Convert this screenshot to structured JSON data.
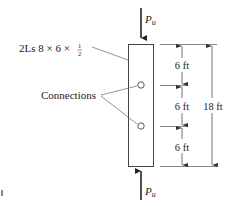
{
  "diagram": {
    "member_label": "2Ls 8 × 6 × ",
    "member_fraction": {
      "num": "1",
      "den": "2"
    },
    "connections_label": "Connections",
    "load_top": {
      "symbol": "P",
      "subscript": "u"
    },
    "load_bottom": {
      "symbol": "P",
      "subscript": "u"
    },
    "segments": [
      "6 ft",
      "6 ft",
      "6 ft"
    ],
    "total_length": "18 ft",
    "colors": {
      "line": "#333333",
      "text": "#222222",
      "background": "#ffffff"
    }
  }
}
